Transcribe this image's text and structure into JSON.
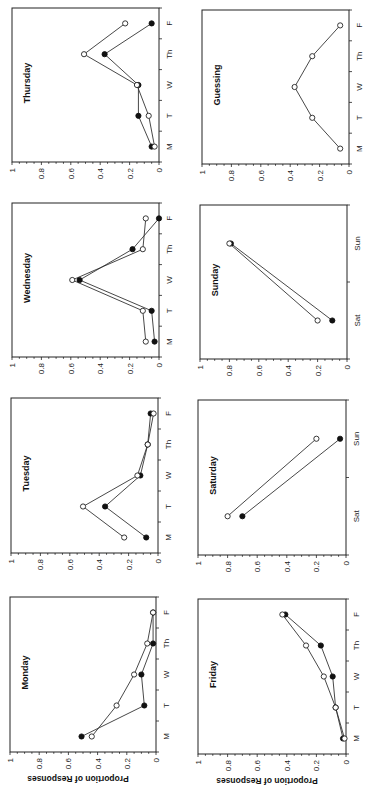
{
  "figure": {
    "ylabel": "Proportion of Responses",
    "rotation_deg": 90
  },
  "chart_data": [
    {
      "type": "line",
      "title": "Monday",
      "categories": [
        "M",
        "T",
        "W",
        "Th",
        "F"
      ],
      "ylabel": "Proportion of Responses",
      "ylim": [
        0,
        1
      ],
      "yticks": [
        "0",
        "0.2",
        "0.4",
        "0.6",
        "0.8",
        "1"
      ],
      "series": [
        {
          "name": "filled",
          "marker": "filled",
          "values": [
            0.51,
            0.08,
            0.1,
            0.02,
            0.02
          ]
        },
        {
          "name": "open",
          "marker": "open",
          "values": [
            0.44,
            0.27,
            0.15,
            0.06,
            0.02
          ]
        }
      ]
    },
    {
      "type": "line",
      "title": "Friday",
      "categories": [
        "M",
        "T",
        "W",
        "Th",
        "F"
      ],
      "ylabel": "Proportion of Responses",
      "ylim": [
        0,
        1
      ],
      "yticks": [
        "0",
        "0.2",
        "0.4",
        "0.6",
        "0.8",
        "1"
      ],
      "series": [
        {
          "name": "filled",
          "marker": "filled",
          "values": [
            0.02,
            0.07,
            0.09,
            0.17,
            0.41
          ]
        },
        {
          "name": "open",
          "marker": "open",
          "values": [
            0.01,
            0.07,
            0.15,
            0.27,
            0.43
          ]
        }
      ]
    },
    {
      "type": "line",
      "title": "Tuesday",
      "categories": [
        "M",
        "T",
        "W",
        "Th",
        "F"
      ],
      "ylim": [
        0,
        1
      ],
      "yticks": [
        "0",
        "0.2",
        "0.4",
        "0.6",
        "0.8",
        "1"
      ],
      "series": [
        {
          "name": "filled",
          "marker": "filled",
          "values": [
            0.08,
            0.36,
            0.12,
            0.07,
            0.05
          ]
        },
        {
          "name": "open",
          "marker": "open",
          "values": [
            0.23,
            0.51,
            0.14,
            0.07,
            0.03
          ]
        }
      ]
    },
    {
      "type": "line",
      "title": "Saturday",
      "categories": [
        "Sat",
        "Sun"
      ],
      "ylim": [
        0,
        1
      ],
      "yticks": [
        "0",
        "0.2",
        "0.4",
        "0.6",
        "0.8",
        "1"
      ],
      "series": [
        {
          "name": "filled",
          "marker": "filled",
          "values": [
            0.7,
            0.04
          ]
        },
        {
          "name": "open",
          "marker": "open",
          "values": [
            0.8,
            0.2
          ]
        }
      ]
    },
    {
      "type": "line",
      "title": "Wednesday",
      "categories": [
        "M",
        "T",
        "W",
        "Th",
        "F"
      ],
      "ylim": [
        0,
        1
      ],
      "yticks": [
        "0",
        "0.2",
        "0.4",
        "0.6",
        "0.8",
        "1"
      ],
      "series": [
        {
          "name": "filled",
          "marker": "filled",
          "values": [
            0.03,
            0.05,
            0.54,
            0.18,
            0.0
          ]
        },
        {
          "name": "open",
          "marker": "open",
          "values": [
            0.09,
            0.11,
            0.59,
            0.11,
            0.09
          ]
        }
      ]
    },
    {
      "type": "line",
      "title": "Sunday",
      "categories": [
        "Sat",
        "Sun"
      ],
      "ylim": [
        0,
        1
      ],
      "yticks": [
        "0",
        "0.2",
        "0.4",
        "0.6",
        "0.8",
        "1"
      ],
      "series": [
        {
          "name": "filled",
          "marker": "filled",
          "values": [
            0.1,
            0.79
          ]
        },
        {
          "name": "open",
          "marker": "open",
          "values": [
            0.2,
            0.8
          ]
        }
      ]
    },
    {
      "type": "line",
      "title": "Thursday",
      "categories": [
        "M",
        "T",
        "W",
        "Th",
        "F"
      ],
      "ylim": [
        0,
        1
      ],
      "yticks": [
        "0",
        "0.2",
        "0.4",
        "0.6",
        "0.8",
        "1"
      ],
      "series": [
        {
          "name": "filled",
          "marker": "filled",
          "values": [
            0.05,
            0.14,
            0.14,
            0.37,
            0.05
          ]
        },
        {
          "name": "open",
          "marker": "open",
          "values": [
            0.03,
            0.07,
            0.15,
            0.51,
            0.23
          ]
        }
      ]
    },
    {
      "type": "line",
      "title": "Guessing",
      "categories": [
        "M",
        "T",
        "W",
        "Th",
        "F"
      ],
      "ylim": [
        0,
        1
      ],
      "yticks": [
        "0",
        "0.2",
        "0.4",
        "0.6",
        "0.8",
        "1"
      ],
      "series": [
        {
          "name": "open",
          "marker": "open",
          "values": [
            0.06,
            0.25,
            0.37,
            0.25,
            0.06
          ]
        }
      ]
    }
  ],
  "layout": {
    "panels": [
      {
        "idx": 6,
        "x0": 12,
        "x1": 159,
        "y0": 8,
        "y1": 162,
        "show_ylabel": false
      },
      {
        "idx": 7,
        "x0": 202,
        "x1": 349,
        "y0": 10,
        "y1": 164,
        "show_ylabel": false
      },
      {
        "idx": 4,
        "x0": 12,
        "x1": 159,
        "y0": 203,
        "y1": 357,
        "show_ylabel": false
      },
      {
        "idx": 5,
        "x0": 200,
        "x1": 347,
        "y0": 205,
        "y1": 359,
        "show_ylabel": false
      },
      {
        "idx": 2,
        "x0": 11,
        "x1": 158,
        "y0": 398,
        "y1": 553,
        "show_ylabel": false
      },
      {
        "idx": 3,
        "x0": 198,
        "x1": 346,
        "y0": 400,
        "y1": 555,
        "show_ylabel": false
      },
      {
        "idx": 0,
        "x0": 10,
        "x1": 156,
        "y0": 597,
        "y1": 752,
        "show_ylabel": true
      },
      {
        "idx": 1,
        "x0": 198,
        "x1": 346,
        "y0": 599,
        "y1": 754,
        "show_ylabel": true
      }
    ]
  }
}
